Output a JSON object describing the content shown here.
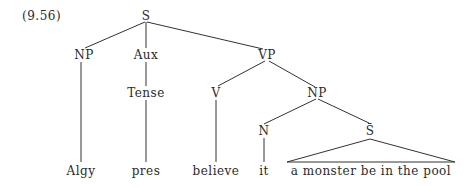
{
  "example_number": "(9.56)",
  "tree": {
    "root": "S",
    "nodes": {
      "s": "S",
      "np1": "NP",
      "aux": "Aux",
      "vp": "VP",
      "tense": "Tense",
      "v": "V",
      "np2": "NP",
      "n": "N",
      "sbar": "S̄"
    },
    "leaves": {
      "algy": "Algy",
      "pres": "pres",
      "believe": "believe",
      "it": "it",
      "clause": "a monster be in the pool"
    },
    "line_color": "#333333"
  }
}
